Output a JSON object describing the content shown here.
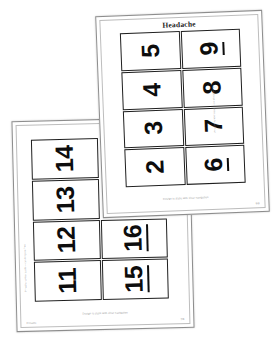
{
  "background_color": "#ffffff",
  "scene": {
    "description": "Two overlapping slightly-rotated printable worksheet pages of large number flashcards",
    "page_count": 2
  },
  "pages": [
    {
      "id": "front-page",
      "title": "Headache",
      "layout": {
        "columns": 2,
        "rows": 4,
        "rotation_deg": -2.2
      },
      "caption": "Design is static with clear navigation",
      "footer_left": "",
      "footer_right": "6/8",
      "side_note": "Printable number cards — cut along the lines",
      "cards": [
        {
          "value": "5",
          "underlined": false
        },
        {
          "value": "9",
          "underlined": true
        },
        {
          "value": "4",
          "underlined": false
        },
        {
          "value": "8",
          "underlined": false
        },
        {
          "value": "3",
          "underlined": false
        },
        {
          "value": "7",
          "underlined": false
        },
        {
          "value": "2",
          "underlined": false
        },
        {
          "value": "6",
          "underlined": true
        }
      ]
    },
    {
      "id": "back-page",
      "title": "Headache",
      "layout": {
        "columns": 2,
        "rows": 4,
        "rotation_deg": -1.4
      },
      "caption": "Design is static with clear navigation",
      "footer_left": "Printable",
      "footer_right": "7/8",
      "side_note": "Printable number cards — cut along the lines",
      "cards": [
        {
          "value": "14",
          "underlined": false
        },
        {
          "value": "",
          "underlined": false,
          "blank": true
        },
        {
          "value": "13",
          "underlined": false
        },
        {
          "value": "",
          "underlined": false,
          "blank": true
        },
        {
          "value": "12",
          "underlined": false
        },
        {
          "value": "16",
          "underlined": true
        },
        {
          "value": "11",
          "underlined": false
        },
        {
          "value": "15",
          "underlined": true
        }
      ]
    }
  ]
}
